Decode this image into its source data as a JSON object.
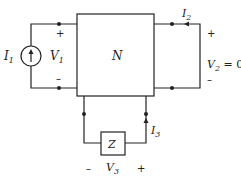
{
  "network": {
    "label": "N"
  },
  "port1": {
    "source_label": "I",
    "source_sub": "1",
    "voltage_label": "V",
    "voltage_sub": "1",
    "plus": "+",
    "minus": "–"
  },
  "port2": {
    "current_label": "I",
    "current_sub": "2",
    "voltage_label": "V",
    "voltage_sub": "2",
    "voltage_value": " = 0",
    "plus": "+",
    "minus": "–"
  },
  "port3": {
    "impedance_label": "Z",
    "current_label": "I",
    "current_sub": "3",
    "voltage_label": "V",
    "voltage_sub": "3",
    "plus": "+",
    "minus": "–"
  }
}
